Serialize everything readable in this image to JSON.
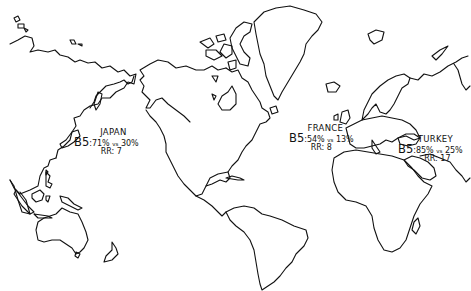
{
  "map": {
    "type": "world-outline-map",
    "projection": "mercator-like",
    "annotations": [
      {
        "country": "JAPAN",
        "marker": "B5",
        "stat_a": "71%",
        "vs_label": "vs",
        "stat_b": "30%",
        "rr": "RR: 7"
      },
      {
        "country": "FRANCE",
        "marker": "B5",
        "stat_a": "54%",
        "vs_label": "vs",
        "stat_b": "13%",
        "rr": "RR: 8"
      },
      {
        "country": "TURKEY",
        "marker": "B5",
        "stat_a": "85%",
        "vs_label": "vs",
        "stat_b": "25%",
        "rr": "RR: 17"
      }
    ]
  }
}
